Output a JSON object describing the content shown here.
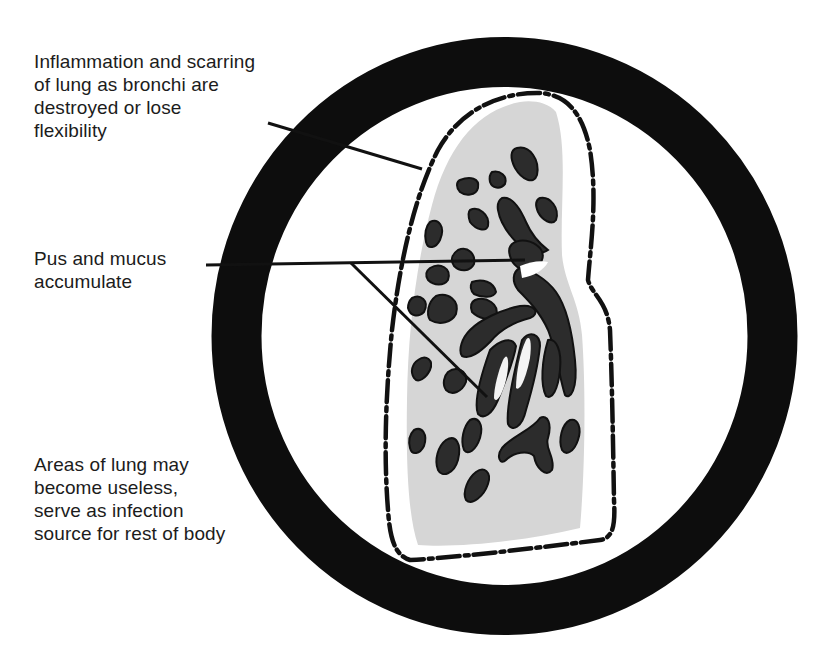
{
  "diagram": {
    "colors": {
      "ring": "#0d0d0d",
      "lung_fill": "#d6d6d6",
      "lesion": "#2a2a2a",
      "outline": "#111111",
      "leader_line": "#111111",
      "text": "#1c1c1c",
      "background": "#ffffff"
    },
    "labels": [
      {
        "id": "inflammation",
        "lines": [
          "Inflammation and scarring",
          "of lung as bronchi are",
          "destroyed or lose",
          "flexibility"
        ]
      },
      {
        "id": "pus",
        "lines": [
          "Pus and mucus",
          "accumulate"
        ]
      },
      {
        "id": "areas",
        "lines": [
          "Areas of lung may",
          "become useless,",
          "serve as infection",
          "source for rest of body"
        ]
      }
    ]
  }
}
